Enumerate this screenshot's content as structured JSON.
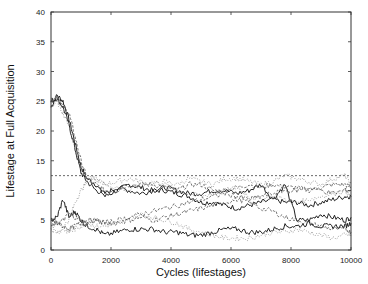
{
  "chart_data": {
    "type": "line",
    "title": "",
    "xlabel": "Cycles (lifestages)",
    "ylabel": "Lifestage at Full Acquisition",
    "xlim": [
      0,
      10000
    ],
    "ylim": [
      0,
      40
    ],
    "xticks": [
      0,
      2000,
      4000,
      6000,
      8000,
      10000
    ],
    "yticks": [
      0,
      5,
      10,
      15,
      20,
      25,
      30,
      35,
      40
    ],
    "grid": false,
    "legend": "none",
    "reference_line": {
      "y": 12.5,
      "style": "dashed"
    },
    "series": [
      {
        "name": "run-1 (solid, starts high)",
        "style": "solid",
        "x": [
          0,
          200,
          400,
          600,
          800,
          1000,
          1200,
          1500,
          1800,
          2200,
          2600,
          3000,
          3400,
          3800,
          4200,
          4600,
          5000,
          5400,
          5800,
          6200,
          6600,
          7000,
          7400,
          7800,
          8200,
          8600,
          9000,
          9400,
          9800,
          10000
        ],
        "y": [
          24,
          26,
          25,
          22,
          18,
          14,
          12,
          11,
          9,
          10,
          11,
          10.5,
          10,
          10,
          9.5,
          9,
          8,
          8,
          7.5,
          7,
          7.5,
          8,
          8.5,
          8,
          8,
          7.5,
          8,
          8.5,
          9,
          9
        ]
      },
      {
        "name": "run-2 (solid, starts high)",
        "style": "solid",
        "x": [
          0,
          200,
          400,
          600,
          800,
          1000,
          1200,
          1500,
          1800,
          2200,
          2600,
          3000,
          3400,
          3800,
          4200,
          4600,
          5000,
          5400,
          5800,
          6200,
          6600,
          7000,
          7400,
          7800,
          8200,
          8600,
          9000,
          9400,
          9800,
          10000
        ],
        "y": [
          25,
          25.5,
          24,
          21,
          17,
          13,
          11.5,
          10,
          9.5,
          10.5,
          10,
          9.5,
          10,
          10.5,
          10,
          9.5,
          9.5,
          10,
          10,
          9.5,
          10,
          11,
          8.5,
          11,
          5,
          5,
          6,
          5.5,
          5,
          5.5
        ]
      },
      {
        "name": "run-3 (dashed, starts high)",
        "style": "dashed",
        "x": [
          0,
          200,
          400,
          600,
          800,
          1000,
          1200,
          1500,
          1800,
          2200,
          2600,
          3000,
          3400,
          3800,
          4200,
          4600,
          5000,
          5400,
          5800,
          6200,
          6600,
          7000,
          7400,
          7800,
          8200,
          8600,
          9000,
          9400,
          9800,
          10000
        ],
        "y": [
          25,
          26,
          24,
          23,
          19,
          15,
          12,
          11,
          10,
          10,
          11,
          11,
          11,
          10.5,
          10,
          11,
          11,
          10,
          10,
          10.5,
          11,
          10.5,
          11,
          10.5,
          10.5,
          10,
          10.5,
          11,
          11,
          10.5
        ]
      },
      {
        "name": "run-4 (dotted, starts high)",
        "style": "dotted",
        "x": [
          0,
          200,
          400,
          600,
          800,
          1000,
          1200,
          1500,
          1800,
          2200,
          2600,
          3000,
          3400,
          3800,
          4200,
          4600,
          5000,
          5400,
          5800,
          6200,
          6600,
          7000,
          7400,
          7800,
          8200,
          8600,
          9000,
          9400,
          9800,
          10000
        ],
        "y": [
          24,
          25,
          23,
          21,
          17,
          14,
          12,
          12,
          11,
          11.5,
          12,
          11.5,
          11,
          11.5,
          11,
          12,
          11.5,
          11,
          12,
          12,
          11.5,
          11,
          11.5,
          12.5,
          12,
          11.5,
          11,
          12,
          12.5,
          11
        ]
      },
      {
        "name": "run-5 (solid, starts low)",
        "style": "solid",
        "x": [
          0,
          200,
          400,
          600,
          800,
          1000,
          1200,
          1500,
          1800,
          2200,
          2600,
          3000,
          3400,
          3800,
          4200,
          4600,
          5000,
          5400,
          5800,
          6200,
          6600,
          7000,
          7400,
          7800,
          8200,
          8600,
          9000,
          9400,
          9800,
          10000
        ],
        "y": [
          5,
          5.5,
          8.5,
          5.5,
          6.5,
          5,
          4,
          3.5,
          2.5,
          3,
          3.5,
          3.5,
          3.5,
          3,
          3,
          2.5,
          2.5,
          3,
          3.5,
          3.5,
          3,
          3,
          3.5,
          4,
          4,
          4.5,
          4,
          4,
          4,
          4.5
        ]
      },
      {
        "name": "run-6 (dotted, starts low, rises)",
        "style": "dotted",
        "x": [
          0,
          200,
          400,
          600,
          800,
          1000,
          1200,
          1500,
          1800,
          2200,
          2600,
          3000,
          3400,
          3800,
          4200,
          4600,
          5000,
          5400,
          5800,
          6200,
          6600,
          7000,
          7400,
          7800,
          8200,
          8600,
          9000,
          9400,
          9800,
          10000
        ],
        "y": [
          4,
          4.5,
          4,
          5,
          8,
          10,
          11.5,
          12,
          11,
          10.5,
          10,
          11,
          11.5,
          11,
          10,
          9.5,
          9,
          9.5,
          10,
          10.5,
          9,
          8.5,
          9,
          8.5,
          8,
          8.5,
          9,
          9.5,
          10,
          9
        ]
      },
      {
        "name": "run-7 (dashed, starts low)",
        "style": "dashed",
        "x": [
          0,
          200,
          400,
          600,
          800,
          1000,
          1200,
          1500,
          1800,
          2200,
          2600,
          3000,
          3400,
          3800,
          4200,
          4600,
          5000,
          5400,
          5800,
          6200,
          6600,
          7000,
          7400,
          7800,
          8200,
          8600,
          9000,
          9400,
          9800,
          10000
        ],
        "y": [
          5,
          4.5,
          5,
          6,
          5.5,
          5,
          4.5,
          5,
          4.5,
          4.5,
          5,
          5.5,
          5,
          5.5,
          6,
          6.5,
          7,
          7.5,
          8,
          8.5,
          8,
          7,
          6.5,
          5.5,
          5,
          4.5,
          4,
          3.5,
          3.5,
          3
        ]
      },
      {
        "name": "run-8 (dotted, starts low)",
        "style": "dotted",
        "x": [
          0,
          200,
          400,
          600,
          800,
          1000,
          1200,
          1500,
          1800,
          2200,
          2600,
          3000,
          3400,
          3800,
          4200,
          4600,
          5000,
          5400,
          5800,
          6200,
          6600,
          7000,
          7400,
          7800,
          8200,
          8600,
          9000,
          9400,
          9800,
          10000
        ],
        "y": [
          3.5,
          3,
          3.5,
          3,
          3.5,
          4,
          4.5,
          4,
          4,
          4.5,
          5,
          6,
          5.5,
          5,
          4.5,
          3.5,
          3,
          2.5,
          2,
          2,
          2,
          2.5,
          3,
          3,
          3.5,
          3,
          2.5,
          2,
          2.5,
          2.5
        ]
      },
      {
        "name": "run-9 (dashed, starts low)",
        "style": "dashed",
        "x": [
          0,
          200,
          400,
          600,
          800,
          1000,
          1200,
          1500,
          1800,
          2200,
          2600,
          3000,
          3400,
          3800,
          4200,
          4600,
          5000,
          5400,
          5800,
          6200,
          6600,
          7000,
          7400,
          7800,
          8200,
          8600,
          9000,
          9400,
          9800,
          10000
        ],
        "y": [
          4,
          4.5,
          4,
          3.5,
          4,
          4.5,
          5,
          5,
          4.5,
          5,
          5.5,
          6,
          6.5,
          7,
          7.5,
          8,
          8.5,
          9,
          9.5,
          9,
          8.5,
          9,
          9.5,
          10,
          10,
          10.5,
          10,
          9.5,
          10,
          10
        ]
      }
    ]
  },
  "axes": {
    "x_tick_labels": [
      "0",
      "2000",
      "4000",
      "6000",
      "8000",
      "10000"
    ],
    "y_tick_labels": [
      "0",
      "5",
      "10",
      "15",
      "20",
      "25",
      "30",
      "35",
      "40"
    ],
    "xlabel": "Cycles (lifestages)",
    "ylabel": "Lifestage at Full Acquisition"
  },
  "colors": {
    "axis": "#333333",
    "line_dark": "#222222",
    "line_mid": "#555555",
    "line_light": "#888888"
  }
}
